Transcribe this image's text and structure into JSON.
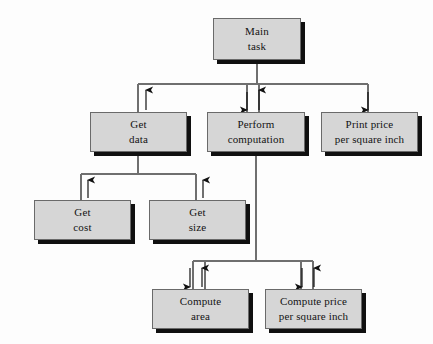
{
  "diagram": {
    "type": "structure-chart",
    "background_color": "#fdfdfd",
    "box_fill_color": "#d6d6d6",
    "box_border_color": "#6a6a6a",
    "shadow_color": "#101010",
    "line_color": "#6f6f6f",
    "arrow_color": "#111111"
  },
  "nodes": [
    {
      "id": "main-task",
      "line1": "Main",
      "line2": "task",
      "x": 213,
      "y": 18,
      "w": 88,
      "h": 42
    },
    {
      "id": "get-data",
      "line1": "Get",
      "line2": "data",
      "x": 90,
      "y": 112,
      "w": 97,
      "h": 40
    },
    {
      "id": "perform-computation",
      "line1": "Perform",
      "line2": "computation",
      "x": 207,
      "y": 112,
      "w": 98,
      "h": 40
    },
    {
      "id": "print-price-per-square-inch",
      "line1": "Print price",
      "line2": "per square inch",
      "x": 321,
      "y": 112,
      "w": 97,
      "h": 40
    },
    {
      "id": "get-cost",
      "line1": "Get",
      "line2": "cost",
      "x": 34,
      "y": 200,
      "w": 97,
      "h": 40
    },
    {
      "id": "get-size",
      "line1": "Get",
      "line2": "size",
      "x": 149,
      "y": 200,
      "w": 97,
      "h": 40
    },
    {
      "id": "compute-area",
      "line1": "Compute",
      "line2": "area",
      "x": 152,
      "y": 289,
      "w": 97,
      "h": 40
    },
    {
      "id": "compute-price-per-square-inch",
      "line1": "Compute price",
      "line2": "per square inch",
      "x": 265,
      "y": 289,
      "w": 97,
      "h": 40
    }
  ],
  "connections": [
    {
      "from": "main-task",
      "to": "get-data",
      "direction": "up"
    },
    {
      "from": "main-task",
      "to": "perform-computation",
      "direction": "both"
    },
    {
      "from": "main-task",
      "to": "print-price-per-square-inch",
      "direction": "down"
    },
    {
      "from": "get-data",
      "to": "get-cost",
      "direction": "up"
    },
    {
      "from": "get-data",
      "to": "get-size",
      "direction": "up"
    },
    {
      "from": "perform-computation",
      "to": "compute-area",
      "direction": "both"
    },
    {
      "from": "perform-computation",
      "to": "compute-price-per-square-inch",
      "direction": "both"
    }
  ]
}
